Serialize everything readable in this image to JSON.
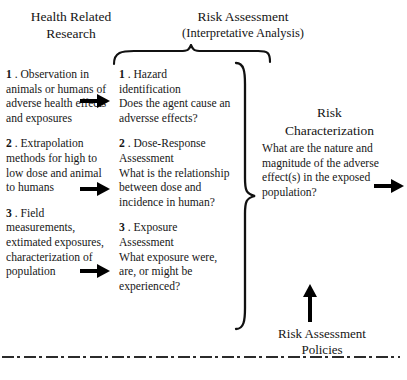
{
  "figure": {
    "background_color": "#ffffff",
    "ink_color": "#1a1a1a"
  },
  "headings": {
    "health_related_research": "Health Related\nResearch",
    "health_related_research_line1": "Health Related",
    "health_related_research_line2": "Research",
    "risk_assessment_title": "Risk Assessment",
    "risk_assessment_subtitle": "(Interpretative Analysis)",
    "risk_characterization_line1": "Risk",
    "risk_characterization_line2": "Characterization",
    "risk_assessment_policies_line1": "Risk Assessment",
    "risk_assessment_policies_line2": "Policies"
  },
  "columns": {
    "health_related_research": [
      {
        "number": "1",
        "separator": " . ",
        "text": "Observation in animals or humans of adverse health effects and exposures"
      },
      {
        "number": "2",
        "separator": " . ",
        "text": "Extrapolation methods for high to low dose and animal to humans"
      },
      {
        "number": "3",
        "separator": " . ",
        "text": "Field measurements, extimated exposures, characterization of population"
      }
    ],
    "risk_assessment": [
      {
        "number": "1",
        "separator": " . ",
        "title": "Hazard identification",
        "question": "Does the agent cause an adversse effects?"
      },
      {
        "number": "2",
        "separator": " . ",
        "title": "Dose-Response Assessment",
        "question": "What is the relationship between dose and incidence in human?"
      },
      {
        "number": "3",
        "separator": " . ",
        "title": "Exposure Assessment",
        "question": "What exposure were, are, or might be experienced?"
      }
    ],
    "risk_characterization": {
      "question": "What are the nature and magnitude of the adverse effect(s) in the exposed population?"
    }
  },
  "connectors": {
    "arrow_observation_to_hazard": "arrow-right",
    "arrow_extrapolation_to_dose": "arrow-right",
    "arrow_field_to_exposure": "arrow-right",
    "arrow_characterization_output": "arrow-right",
    "arrow_policies_up": "arrow-up",
    "brace_top": "curly-brace-top",
    "brace_right": "curly-brace-right"
  },
  "footer": {
    "rule_style": "dash-dot",
    "cut_off_text": ""
  }
}
